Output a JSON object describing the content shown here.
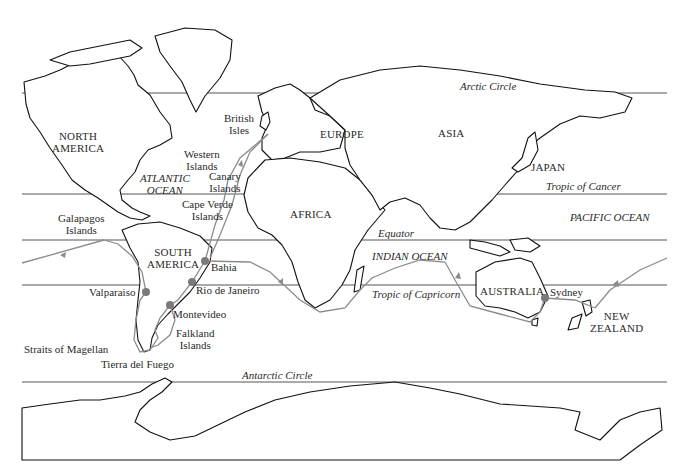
{
  "map": {
    "title": "Route of the voyage",
    "colors": {
      "background": "#ffffff",
      "land_outline": "#111111",
      "latitude_line": "#555555",
      "route": "#8c8c8c",
      "stop_marker": "#7a7a7a"
    },
    "latitude_lines": [
      {
        "name": "Arctic Circle",
        "y": 93
      },
      {
        "name": "Tropic of Cancer",
        "y": 194
      },
      {
        "name": "Equator",
        "y": 240
      },
      {
        "name": "Tropic of Capricorn",
        "y": 285
      },
      {
        "name": "Antarctic Circle",
        "y": 382
      }
    ],
    "labels": {
      "arctic_circle": "Arctic Circle",
      "tropic_cancer": "Tropic of Cancer",
      "equator": "Equator",
      "tropic_capricorn": "Tropic of Capricorn",
      "antarctic_circle": "Antarctic Circle",
      "north_america_1": "NORTH",
      "north_america_2": "AMERICA",
      "south_america_1": "SOUTH",
      "south_america_2": "AMERICA",
      "europe": "EUROPE",
      "asia": "ASIA",
      "africa": "AFRICA",
      "australia": "AUSTRALIA",
      "japan": "JAPAN",
      "new_zealand_1": "NEW",
      "new_zealand_2": "ZEALAND",
      "atlantic_1": "ATLANTIC",
      "atlantic_2": "OCEAN",
      "pacific": "PACIFIC OCEAN",
      "indian": "INDIAN OCEAN",
      "british_1": "British",
      "british_2": "Isles",
      "western_1": "Western",
      "western_2": "Islands",
      "canary_1": "Canary",
      "canary_2": "Islands",
      "cape_verde_1": "Cape Verde",
      "cape_verde_2": "Islands",
      "galapagos_1": "Galapagos",
      "galapagos_2": "Islands",
      "bahia": "Bahia",
      "rio": "Rio de Janeiro",
      "valparaiso": "Valparaiso",
      "montevideo": "Montevideo",
      "falkland_1": "Falkland",
      "falkland_2": "Islands",
      "magellan": "Straits of Magellan",
      "tierra": "Tierra del Fuego",
      "sydney": "Sydney"
    },
    "stops": [
      {
        "name": "Bahia",
        "x": 205,
        "y": 261
      },
      {
        "name": "Rio de Janeiro",
        "x": 192,
        "y": 282
      },
      {
        "name": "Montevideo",
        "x": 170,
        "y": 305
      },
      {
        "name": "Valparaiso",
        "x": 146,
        "y": 292
      },
      {
        "name": "Sydney",
        "x": 545,
        "y": 298
      }
    ]
  }
}
